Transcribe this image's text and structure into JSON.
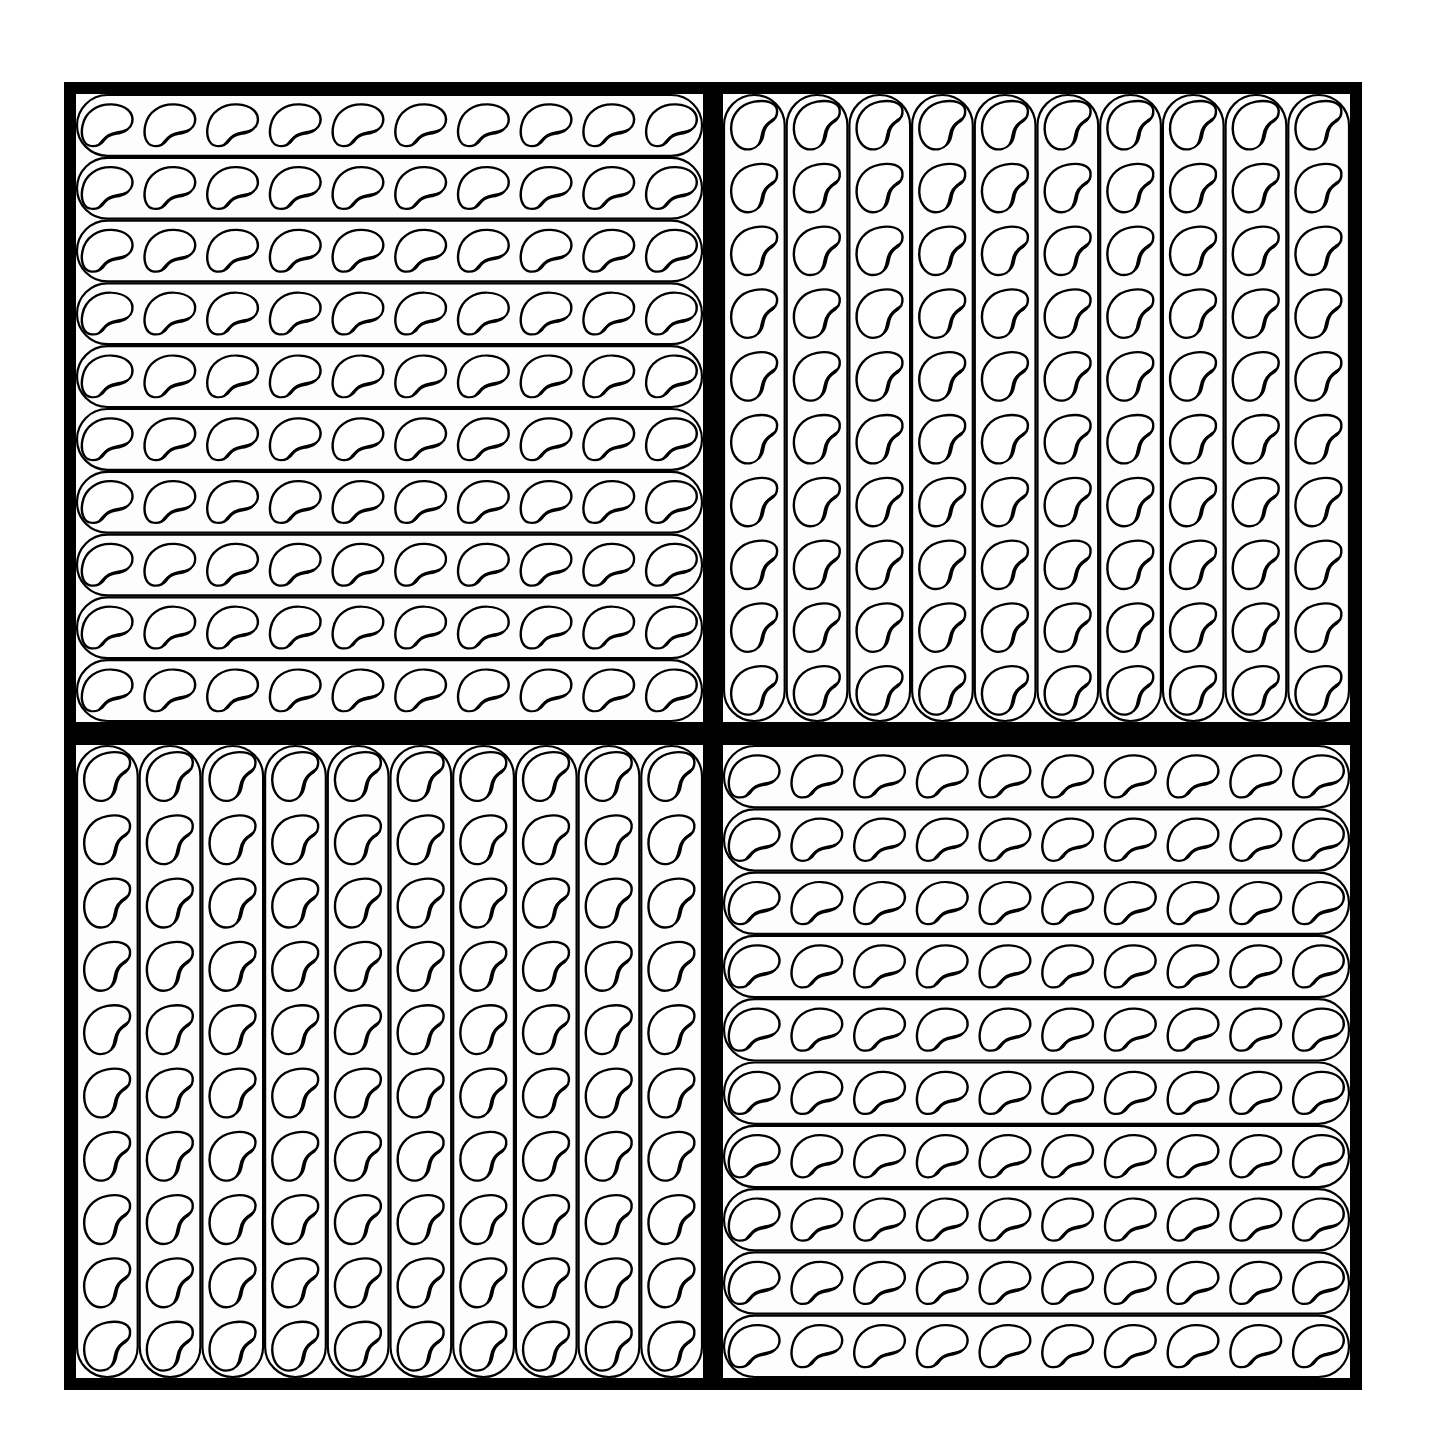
{
  "figure": {
    "title": "Bean sticks: four flats of 100 beans",
    "background": "#ffffff",
    "ink": "#000000",
    "paper": "#fdfdfd",
    "frame": {
      "x": 64,
      "y": 82,
      "width": 1298,
      "height": 1308,
      "thickness": 12
    },
    "dividers": {
      "vertical": {
        "x": 703,
        "width": 20
      },
      "horizontal": {
        "y": 722,
        "height": 23
      }
    },
    "panels": [
      {
        "id": "top-left",
        "orientation": "horizontal",
        "x": 76,
        "y": 94,
        "width": 627,
        "height": 628,
        "sticks": 10,
        "beans_per_stick": 10
      },
      {
        "id": "top-right",
        "orientation": "vertical",
        "x": 723,
        "y": 94,
        "width": 627,
        "height": 628,
        "sticks": 10,
        "beans_per_stick": 10
      },
      {
        "id": "bottom-left",
        "orientation": "vertical",
        "x": 76,
        "y": 745,
        "width": 627,
        "height": 633,
        "sticks": 10,
        "beans_per_stick": 10
      },
      {
        "id": "bottom-right",
        "orientation": "horizontal",
        "x": 723,
        "y": 745,
        "width": 627,
        "height": 633,
        "sticks": 10,
        "beans_per_stick": 10
      }
    ],
    "totals": {
      "panels": 4,
      "beans_per_panel": 100,
      "total_beans": 400
    }
  }
}
